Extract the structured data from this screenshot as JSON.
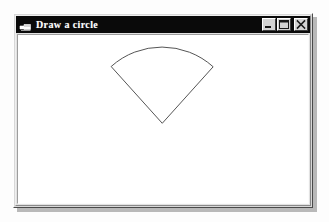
{
  "page": {
    "background_color": "#fdfdfd",
    "width": 329,
    "height": 222
  },
  "window": {
    "title": "Draw a circle",
    "icon_name": "vb-form-icon",
    "titlebar_color": "#0a0a0a",
    "titlebar_text_color": "#ffffff",
    "frame_color": "#d8d8d8",
    "client_background": "#ffffff",
    "shadow_color": "#b9b9b9",
    "bounds": {
      "left": 13,
      "top": 13,
      "width": 300,
      "height": 195
    },
    "caption_buttons": [
      {
        "name": "minimize-button",
        "label": "Minimize",
        "glyph": "minimize-icon"
      },
      {
        "name": "maximize-button",
        "label": "Maximize",
        "glyph": "maximize-icon"
      },
      {
        "name": "close-button",
        "label": "Close",
        "glyph": "close-icon"
      }
    ]
  },
  "drawing": {
    "shape_name": "pie-sector",
    "description": "Circular sector (pie slice) opening upward",
    "stroke_color": "#555555",
    "fill_color": "none",
    "stroke_width": 1,
    "center": {
      "x": 161,
      "y": 122
    },
    "radius": 76,
    "start_angle_deg": 228,
    "end_angle_deg": 312,
    "sweep_deg": 84,
    "apex": {
      "x": 161,
      "y": 122
    },
    "arc_start": {
      "x": 104,
      "y": 81
    },
    "arc_top": {
      "x": 162,
      "y": 57
    },
    "arc_end": {
      "x": 219,
      "y": 81
    },
    "canvas": {
      "width": 292,
      "height": 170
    }
  }
}
